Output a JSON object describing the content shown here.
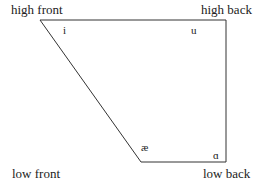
{
  "diagram": {
    "corners": {
      "high_front": "high front",
      "high_back": "high back",
      "low_front": "low front",
      "low_back": "low back"
    },
    "vowels": {
      "i": "i",
      "u": "u",
      "ae": "æ",
      "a": "ɑ"
    },
    "line_color": "#333333"
  }
}
